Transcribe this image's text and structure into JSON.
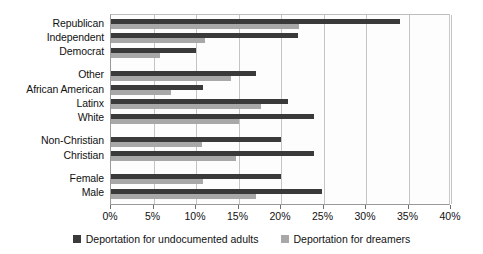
{
  "chart_data": {
    "type": "bar",
    "orientation": "horizontal",
    "title": "",
    "xlabel": "",
    "ylabel": "",
    "xlim": [
      0,
      40
    ],
    "xunit": "%",
    "grid": true,
    "legend_position": "bottom",
    "xticks": [
      "0%",
      "5%",
      "10%",
      "15%",
      "20%",
      "25%",
      "30%",
      "35%",
      "40%"
    ],
    "xtick_values": [
      0,
      5,
      10,
      15,
      20,
      25,
      30,
      35,
      40
    ],
    "categories": [
      "Republican",
      "Independent",
      "Democrat",
      "Other",
      "African American",
      "Latinx",
      "White",
      "Non-Christian",
      "Christian",
      "Female",
      "Male"
    ],
    "group_breaks_after": [
      "Democrat",
      "White",
      "Christian"
    ],
    "series": [
      {
        "name": "Deportation for undocumented adults",
        "color": "#3a3a3a",
        "values": [
          34.0,
          22.0,
          10.0,
          17.0,
          10.8,
          20.8,
          23.9,
          20.0,
          23.9,
          20.0,
          24.8
        ]
      },
      {
        "name": "Deportation for dreamers",
        "color": "#a8a8a8",
        "values": [
          22.1,
          11.0,
          5.8,
          14.1,
          7.1,
          17.7,
          15.0,
          10.7,
          14.7,
          10.8,
          17.0
        ]
      }
    ]
  },
  "legend": {
    "items": [
      {
        "label": "Deportation for undocumented adults",
        "swatch": "dark-swatch-icon"
      },
      {
        "label": "Deportation for dreamers",
        "swatch": "light-swatch-icon"
      }
    ]
  }
}
